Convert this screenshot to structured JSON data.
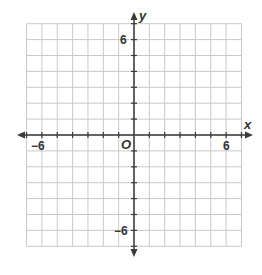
{
  "chart_data": {
    "type": "scatter",
    "title": "",
    "xlabel": "x",
    "ylabel": "y",
    "origin_label": "O",
    "xlim": [
      -7,
      7
    ],
    "ylim": [
      -7,
      7
    ],
    "grid": true,
    "x_tick_labels": [
      {
        "value": -6,
        "label": "−6"
      },
      {
        "value": 6,
        "label": "6"
      }
    ],
    "y_tick_labels": [
      {
        "value": 6,
        "label": "6"
      },
      {
        "value": -6,
        "label": "−6"
      }
    ],
    "series": [],
    "colors": {
      "grid": "#c9c9c9",
      "axis": "#3a3a3a",
      "text": "#333333"
    }
  },
  "labels": {
    "x_axis": "x",
    "y_axis": "y",
    "origin": "O",
    "x_neg6": "−6",
    "x_pos6": "6",
    "y_pos6": "6",
    "y_neg6": "−6"
  }
}
